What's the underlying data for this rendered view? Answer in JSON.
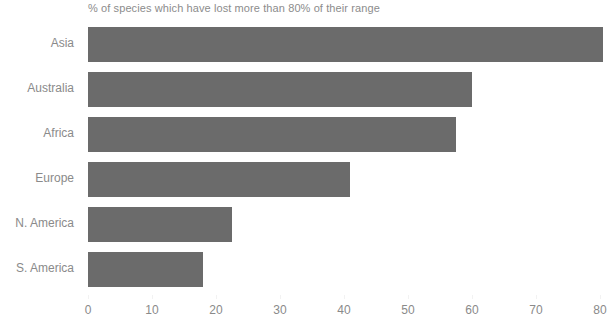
{
  "chart_data": {
    "type": "bar",
    "orientation": "horizontal",
    "title": "% of species which have lost more than 80% of their range",
    "xlabel": "",
    "ylabel": "",
    "categories": [
      "Asia",
      "Australia",
      "Africa",
      "Europe",
      "N. America",
      "S. America"
    ],
    "values": [
      80.5,
      60.0,
      57.5,
      41.0,
      22.5,
      18.0
    ],
    "xlim": [
      0,
      80
    ],
    "xticks": [
      0,
      10,
      20,
      30,
      40,
      50,
      60,
      70,
      80
    ],
    "xtick_labels": [
      "0",
      "10",
      "20",
      "30",
      "40",
      "50",
      "60",
      "70",
      "80"
    ],
    "grid": false,
    "legend": false,
    "bar_color": "#6b6b6b",
    "text_color": "#8a8a8a",
    "background_color": "#ffffff"
  }
}
